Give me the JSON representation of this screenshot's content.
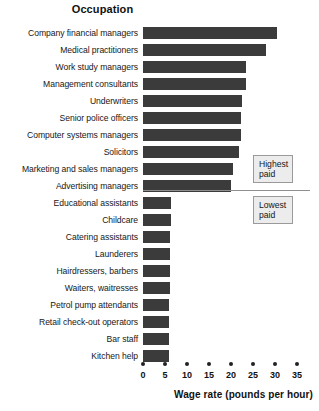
{
  "chart_data": {
    "type": "bar",
    "orientation": "horizontal",
    "title": "Occupation",
    "xlabel": "Wage rate (pounds per hour)",
    "ylabel": "Occupation",
    "xlim": [
      0,
      35
    ],
    "xticks": [
      0,
      5,
      10,
      15,
      20,
      25,
      30,
      35
    ],
    "grid": false,
    "legend": "none",
    "bar_color": "#3b3b3b",
    "categories": [
      "Company financial managers",
      "Medical practitioners",
      "Work study managers",
      "Management consultants",
      "Underwriters",
      "Senior police officers",
      "Computer systems managers",
      "Solicitors",
      "Marketing and sales managers",
      "Advertising managers",
      "Educational assistants",
      "Childcare",
      "Catering assistants",
      "Launderers",
      "Hairdressers, barbers",
      "Waiters, waitresses",
      "Petrol pump attendants",
      "Retail check-out operators",
      "Bar staff",
      "Kitchen help"
    ],
    "values": [
      30.5,
      28.0,
      23.5,
      23.5,
      22.5,
      22.3,
      22.3,
      21.8,
      20.5,
      20.0,
      6.3,
      6.3,
      6.2,
      6.2,
      6.1,
      6.1,
      6.0,
      6.0,
      5.9,
      5.9
    ],
    "annotations": [
      {
        "label": "Highest\npaid",
        "applies_to_rows": "0-9"
      },
      {
        "label": "Lowest\npaid",
        "applies_to_rows": "10-19"
      }
    ]
  },
  "callouts": {
    "highest": "Highest\npaid",
    "lowest": "Lowest\npaid"
  }
}
